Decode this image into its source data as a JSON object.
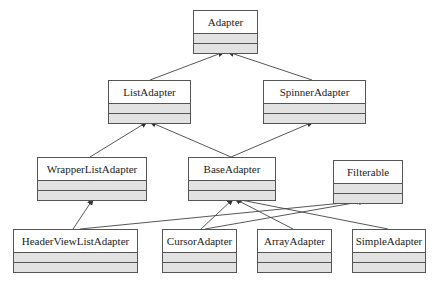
{
  "diagram": {
    "type": "uml-class-hierarchy",
    "classes": [
      {
        "id": "adapter",
        "label": "Adapter",
        "x": 193,
        "y": 10,
        "w": 65,
        "h": 42
      },
      {
        "id": "listadapter",
        "label": "ListAdapter",
        "x": 108,
        "y": 80,
        "w": 83,
        "h": 42
      },
      {
        "id": "spinneradapter",
        "label": "SpinnerAdapter",
        "x": 263,
        "y": 80,
        "w": 103,
        "h": 42
      },
      {
        "id": "wrapperlistadapter",
        "label": "WrapperListAdapter",
        "x": 37,
        "y": 157,
        "w": 110,
        "h": 42
      },
      {
        "id": "baseadapter",
        "label": "BaseAdapter",
        "x": 188,
        "y": 157,
        "w": 88,
        "h": 42
      },
      {
        "id": "filterable",
        "label": "Filterable",
        "x": 333,
        "y": 160,
        "w": 70,
        "h": 41
      },
      {
        "id": "headerviewlistadapter",
        "label": "HeaderViewListAdapter",
        "x": 13,
        "y": 229,
        "w": 125,
        "h": 42
      },
      {
        "id": "cursoradapter",
        "label": "CursorAdapter",
        "x": 162,
        "y": 229,
        "w": 75,
        "h": 42
      },
      {
        "id": "arrayadapter",
        "label": "ArrayAdapter",
        "x": 257,
        "y": 229,
        "w": 75,
        "h": 42
      },
      {
        "id": "simpleadapter",
        "label": "SimpleAdapter",
        "x": 352,
        "y": 229,
        "w": 74,
        "h": 42
      }
    ],
    "edges": [
      {
        "from": "listadapter",
        "to": "adapter",
        "x1": 150,
        "y1": 80,
        "x2": 224,
        "y2": 52
      },
      {
        "from": "spinneradapter",
        "to": "adapter",
        "x1": 312,
        "y1": 80,
        "x2": 228,
        "y2": 52
      },
      {
        "from": "wrapperlistadapter",
        "to": "listadapter",
        "x1": 90,
        "y1": 157,
        "x2": 147,
        "y2": 122
      },
      {
        "from": "baseadapter",
        "to": "listadapter",
        "x1": 231,
        "y1": 157,
        "x2": 150,
        "y2": 122
      },
      {
        "from": "baseadapter",
        "to": "spinneradapter",
        "x1": 231,
        "y1": 157,
        "x2": 313,
        "y2": 122
      },
      {
        "from": "headerviewlistadapter",
        "to": "wrapperlistadapter",
        "x1": 73,
        "y1": 229,
        "x2": 93,
        "y2": 199
      },
      {
        "from": "headerviewlistadapter",
        "to": "filterable",
        "x1": 80,
        "y1": 229,
        "x2": 363,
        "y2": 201
      },
      {
        "from": "cursoradapter",
        "to": "baseadapter",
        "x1": 201,
        "y1": 229,
        "x2": 233,
        "y2": 199
      },
      {
        "from": "cursoradapter",
        "to": "filterable",
        "x1": 205,
        "y1": 229,
        "x2": 365,
        "y2": 201
      },
      {
        "from": "arrayadapter",
        "to": "baseadapter",
        "x1": 293,
        "y1": 229,
        "x2": 235,
        "y2": 199
      },
      {
        "from": "simpleadapter",
        "to": "baseadapter",
        "x1": 388,
        "y1": 229,
        "x2": 236,
        "y2": 199
      }
    ]
  }
}
